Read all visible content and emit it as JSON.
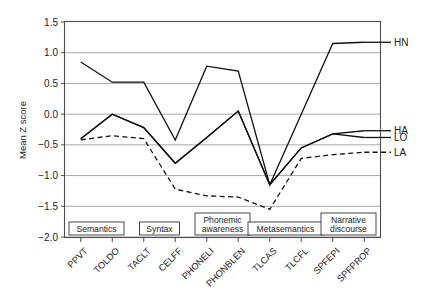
{
  "chart_data": {
    "type": "line",
    "title": "",
    "xlabel": "",
    "ylabel": "Mean Z score",
    "ylim": [
      -2.0,
      1.5
    ],
    "yticks": [
      1.5,
      1.0,
      0.5,
      0.0,
      -0.5,
      -1.0,
      -1.5,
      -2.0
    ],
    "ytick_labels": [
      "1.5",
      "1.0",
      "0.5",
      "0.0",
      "−0.5",
      "−1.0",
      "−1.5",
      "−2.0"
    ],
    "grid": true,
    "legend_position": "right-inline",
    "categories": [
      "PPVT",
      "TOLDO",
      "TACLT",
      "CELFF",
      "PHONELI",
      "PHONBLEN",
      "TLCAS",
      "TLCFL",
      "SPFEPI",
      "SPFPROP"
    ],
    "series": [
      {
        "name": "HN",
        "style": "solid",
        "values": [
          0.85,
          0.52,
          0.52,
          -0.42,
          0.78,
          0.7,
          -1.15,
          0.0,
          1.15,
          1.17
        ]
      },
      {
        "name": "HA",
        "style": "solid",
        "values": [
          -0.4,
          0.0,
          -0.22,
          -0.8,
          -0.38,
          0.05,
          -1.15,
          -0.55,
          -0.32,
          -0.27
        ]
      },
      {
        "name": "LO",
        "style": "solid",
        "values": [
          -0.4,
          0.0,
          -0.22,
          -0.8,
          -0.38,
          0.05,
          -1.15,
          -0.55,
          -0.32,
          -0.38
        ]
      },
      {
        "name": "LA",
        "style": "dashed",
        "values": [
          -0.42,
          -0.35,
          -0.4,
          -1.22,
          -1.33,
          -1.35,
          -1.55,
          -0.72,
          -0.66,
          -0.62
        ]
      }
    ],
    "category_groups": [
      {
        "label": "Semantics",
        "spans": [
          "PPVT",
          "TOLDO"
        ]
      },
      {
        "label": "Syntax",
        "spans": [
          "TACLT",
          "CELFF"
        ]
      },
      {
        "label": "Phonemic awareness",
        "spans": [
          "PHONELI",
          "PHONBLEN"
        ]
      },
      {
        "label": "Metasemantics",
        "spans": [
          "TLCAS",
          "TLCFL"
        ]
      },
      {
        "label": "Narrative discourse",
        "spans": [
          "SPFEPI",
          "SPFPROP"
        ]
      }
    ],
    "legend_entries": [
      {
        "label": "HN",
        "style": "solid"
      },
      {
        "label": "HA",
        "style": "solid"
      },
      {
        "label": "LO",
        "style": "solid"
      },
      {
        "label": "LA",
        "style": "dashed"
      }
    ]
  },
  "colors": {
    "line": "#111111",
    "grid": "#a8a8a8",
    "frame": "#4d4d4d",
    "background": "#ffffff"
  }
}
